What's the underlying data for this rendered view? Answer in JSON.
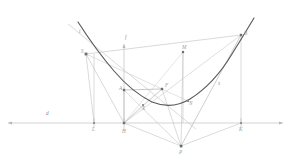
{
  "figure": {
    "canvas": {
      "width": 291,
      "height": 161,
      "background": "#ffffff"
    },
    "colors": {
      "curve": "#4a4a4a",
      "thin_line": "#b9b9b9",
      "mid_line": "#a8a8a8",
      "directrix": "#b0b0b0",
      "label": "#8f8f8f",
      "point": "#707070"
    }
  },
  "lines": {
    "directrix": {
      "label": "d",
      "label_x": 46,
      "label_y": 115,
      "y": 123,
      "x1": 8,
      "x2": 283
    },
    "axis": {
      "label": "f",
      "label_x": 125,
      "label_y": 39,
      "x": 124,
      "y1": 44,
      "y2": 123
    },
    "tangent": {
      "label": "t",
      "label_x": 79,
      "label_y": 33
    },
    "segment_s": {
      "label": "s",
      "label_x": 218,
      "label_y": 85
    }
  },
  "points": [
    {
      "name": "S",
      "label": "S",
      "x": 86,
      "y": 54,
      "label_dx": -5,
      "label_dy": -1
    },
    {
      "name": "A",
      "label": "A",
      "x": 124,
      "y": 90,
      "label_dx": -5,
      "label_dy": 0
    },
    {
      "name": "F",
      "label": "F",
      "x": 162,
      "y": 89,
      "label_dx": 3,
      "label_dy": -2
    },
    {
      "name": "M",
      "label": "M",
      "x": 183,
      "y": 52,
      "label_dx": -1,
      "label_dy": -3
    },
    {
      "name": "B",
      "label": "B",
      "x": 241,
      "y": 35,
      "label_dx": 3,
      "label_dy": 0
    },
    {
      "name": "N",
      "label": "N",
      "x": 188,
      "y": 101,
      "label_dx": 1,
      "label_dy": 4
    },
    {
      "name": "X",
      "label": "X",
      "x": 143,
      "y": 105,
      "label_dx": -1,
      "label_dy": 5
    },
    {
      "name": "L",
      "label": "L",
      "x": 94,
      "y": 123,
      "label_dx": -1,
      "label_dy": 7
    },
    {
      "name": "H",
      "label": "H",
      "x": 124,
      "y": 123,
      "label_dx": -1,
      "label_dy": 7
    },
    {
      "name": "K",
      "label": "K",
      "x": 241,
      "y": 123,
      "label_dx": -1,
      "label_dy": 7
    },
    {
      "name": "P",
      "label": "P",
      "x": 181,
      "y": 146,
      "label_dx": -1,
      "label_dy": 7
    }
  ],
  "curve": {
    "name": "parabola",
    "path": "M 78 22 Q 95 48 113 70 Q 131 92 152 102 Q 173 109 191 99 Q 214 85 232 55 Q 245 33 254 18"
  },
  "geometry_notes": {
    "vertex_label": "",
    "focus_label": "F",
    "directrix_label": "d"
  }
}
